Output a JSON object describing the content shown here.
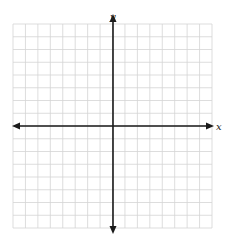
{
  "diagram": {
    "type": "coordinate-plane",
    "x_axis_label": "x",
    "y_axis_label": "y",
    "grid": {
      "columns": 16,
      "rows": 16,
      "left": 13,
      "top": 24,
      "right": 212,
      "bottom": 228,
      "line_color": "#d4d4d4"
    },
    "axes": {
      "origin_x": 113,
      "origin_y": 126,
      "x_start": 12,
      "x_end": 214,
      "y_start": 14,
      "y_end": 234,
      "color": "#1a1a1a"
    }
  }
}
